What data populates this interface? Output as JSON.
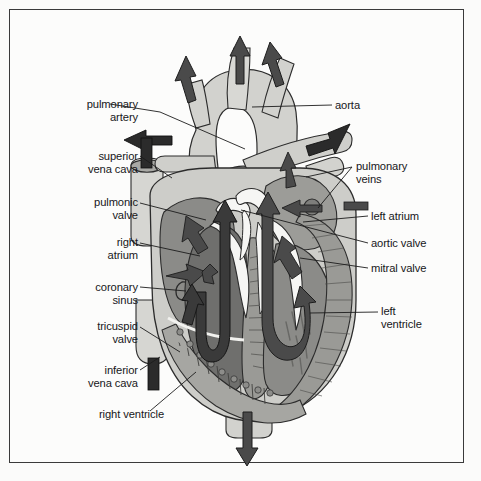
{
  "figure": {
    "domain": "diagram",
    "background_color": "#fbfbfa",
    "frame_color": "#3a3a3a"
  },
  "palette": {
    "vessel_light": "#d2d2ce",
    "vessel_light2": "#c8c8c4",
    "chamber_mid": "#8b8b88",
    "chamber_dark": "#6f6f6d",
    "muscle": "#9a9a96",
    "muscle_dark": "#82827e",
    "arrow_dark": "#4a4a4a",
    "arrow_black": "#2b2b2b",
    "valve_white": "#f6f6f4",
    "outline": "#2c2c2c",
    "leader": "#1c1c1c",
    "text": "#17171a"
  },
  "labels_left": [
    {
      "id": "pulmonary-artery",
      "lines": [
        "pulmonary",
        "artery"
      ],
      "x": 38,
      "y": 98,
      "w": 100,
      "align": "right"
    },
    {
      "id": "superior-vena-cava",
      "lines": [
        "superior",
        "vena cava"
      ],
      "x": 22,
      "y": 150,
      "w": 116,
      "align": "right"
    },
    {
      "id": "pulmonic-valve",
      "lines": [
        "pulmonic",
        "valve"
      ],
      "x": 38,
      "y": 196,
      "w": 100,
      "align": "right"
    },
    {
      "id": "right-atrium",
      "lines": [
        "right",
        "atrium"
      ],
      "x": 48,
      "y": 236,
      "w": 90,
      "align": "right"
    },
    {
      "id": "coronary-sinus",
      "lines": [
        "coronary",
        "sinus"
      ],
      "x": 38,
      "y": 281,
      "w": 100,
      "align": "right"
    },
    {
      "id": "tricuspid-valve",
      "lines": [
        "tricuspid",
        "valve"
      ],
      "x": 38,
      "y": 320,
      "w": 100,
      "align": "right"
    },
    {
      "id": "inferior-vena-cava",
      "lines": [
        "inferior",
        "vena cava"
      ],
      "x": 22,
      "y": 364,
      "w": 116,
      "align": "right"
    },
    {
      "id": "right-ventricle",
      "lines": [
        "right ventricle"
      ],
      "x": 44,
      "y": 408,
      "w": 120,
      "align": "right"
    }
  ],
  "labels_right": [
    {
      "id": "aorta",
      "lines": [
        "aorta"
      ],
      "x": 335,
      "y": 99,
      "w": 100,
      "align": "left"
    },
    {
      "id": "pulmonary-veins",
      "lines": [
        "pulmonary",
        "veins"
      ],
      "x": 356,
      "y": 160,
      "w": 110,
      "align": "left"
    },
    {
      "id": "left-atrium",
      "lines": [
        "left atrium"
      ],
      "x": 371,
      "y": 210,
      "w": 100,
      "align": "left"
    },
    {
      "id": "aortic-valve",
      "lines": [
        "aortic valve"
      ],
      "x": 371,
      "y": 237,
      "w": 100,
      "align": "left"
    },
    {
      "id": "mitral-valve",
      "lines": [
        "mitral valve"
      ],
      "x": 371,
      "y": 262,
      "w": 100,
      "align": "left"
    },
    {
      "id": "left-ventricle",
      "lines": [
        "left",
        "ventricle"
      ],
      "x": 381,
      "y": 305,
      "w": 90,
      "align": "left"
    }
  ],
  "leaders": [
    {
      "id": "pulmonary-artery",
      "pts": "110,104 160,112 245,149"
    },
    {
      "id": "superior-vena-cava",
      "pts": "140,156 172,178"
    },
    {
      "id": "pulmonic-valve",
      "pts": "140,203 206,220"
    },
    {
      "id": "right-atrium",
      "pts": "140,243 200,256"
    },
    {
      "id": "coronary-sinus",
      "pts": "140,287 186,291"
    },
    {
      "id": "tricuspid-valve",
      "pts": "140,327 180,352"
    },
    {
      "id": "inferior-vena-cava",
      "pts": "140,370 160,357"
    },
    {
      "id": "right-ventricle",
      "pts": "150,411 196,372"
    },
    {
      "id": "aorta",
      "pts": "332,105 252,107"
    },
    {
      "id": "pulmonary-veins-a",
      "pts": "352,167 306,177"
    },
    {
      "id": "pulmonary-veins-b",
      "pts": "352,167 318,208"
    },
    {
      "id": "left-atrium",
      "pts": "368,216 303,222"
    },
    {
      "id": "aortic-valve",
      "pts": "368,243 241,210"
    },
    {
      "id": "mitral-valve",
      "pts": "368,268 300,258"
    },
    {
      "id": "left-ventricle",
      "pts": "378,312 310,313"
    }
  ],
  "flow_arrows": [
    {
      "id": "aorta-branch-1-out",
      "direction": "up"
    },
    {
      "id": "aorta-branch-2-out",
      "direction": "up"
    },
    {
      "id": "aorta-branch-3-out",
      "direction": "up-right"
    },
    {
      "id": "left-pulmonary-artery-out",
      "direction": "left"
    },
    {
      "id": "right-pulmonary-artery-out",
      "direction": "right"
    },
    {
      "id": "superior-vena-cava-in",
      "direction": "down"
    },
    {
      "id": "inferior-vena-cava-in",
      "direction": "up"
    },
    {
      "id": "pulmonary-vein-upper-in",
      "direction": "down-left"
    },
    {
      "id": "pulmonary-vein-lower-in",
      "direction": "left"
    },
    {
      "id": "right-atrium-flow",
      "direction": "down"
    },
    {
      "id": "right-atrium-flow-2",
      "direction": "up-left"
    },
    {
      "id": "right-ventricle-outflow",
      "direction": "up"
    },
    {
      "id": "left-ventricle-outflow",
      "direction": "up"
    },
    {
      "id": "descending-aorta-out",
      "direction": "down"
    }
  ],
  "structures": [
    "aortic-arch",
    "ascending-aorta",
    "descending-aorta",
    "pulmonary-trunk",
    "left-pulmonary-artery",
    "right-pulmonary-artery",
    "superior-vena-cava",
    "inferior-vena-cava",
    "right-atrium",
    "right-ventricle",
    "left-atrium",
    "left-ventricle",
    "interventricular-septum",
    "tricuspid-valve",
    "mitral-valve",
    "aortic-valve",
    "pulmonic-valve",
    "coronary-sinus",
    "pulmonary-veins",
    "trabeculae-carneae",
    "papillary-muscle"
  ]
}
